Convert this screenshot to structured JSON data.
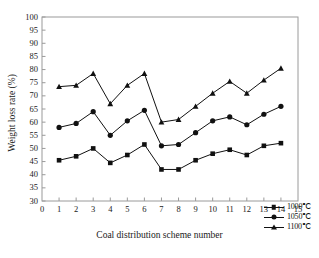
{
  "chart_data": {
    "type": "line",
    "title": "",
    "xlabel": "Coal distribution scheme number",
    "ylabel": "Weight loss rate (%)",
    "xlim": [
      0,
      15
    ],
    "ylim": [
      30,
      100
    ],
    "xticks": [
      0,
      1,
      2,
      3,
      4,
      5,
      6,
      7,
      8,
      9,
      10,
      11,
      12,
      13,
      14,
      15
    ],
    "yticks": [
      30,
      35,
      40,
      45,
      50,
      55,
      60,
      65,
      70,
      75,
      80,
      85,
      90,
      95,
      100
    ],
    "grid": false,
    "legend_position": "lower-right",
    "x": [
      1,
      2,
      3,
      4,
      5,
      6,
      7,
      8,
      9,
      10,
      11,
      12,
      13,
      14
    ],
    "series": [
      {
        "name": "1000℃",
        "marker": "square",
        "color": "#111111",
        "values": [
          45.5,
          47.0,
          50.0,
          44.5,
          47.5,
          51.5,
          42.0,
          42.0,
          45.5,
          48.0,
          49.5,
          47.5,
          51.0,
          52.0
        ]
      },
      {
        "name": "1050℃",
        "marker": "circle",
        "color": "#111111",
        "values": [
          58.0,
          59.5,
          64.0,
          55.0,
          60.5,
          64.5,
          51.0,
          51.5,
          56.0,
          60.5,
          62.0,
          59.0,
          63.0,
          66.0
        ]
      },
      {
        "name": "1100℃",
        "marker": "triangle",
        "color": "#111111",
        "values": [
          73.5,
          74.0,
          78.5,
          67.0,
          74.0,
          78.5,
          60.0,
          61.0,
          66.0,
          71.0,
          75.5,
          71.0,
          76.0,
          80.5
        ]
      }
    ]
  },
  "axes": {
    "frame_color": "#9a9a9a",
    "text_color": "#1a1a1a"
  },
  "legend": {
    "entries": [
      {
        "label": "1000℃",
        "marker": "square"
      },
      {
        "label": "1050℃",
        "marker": "circle"
      },
      {
        "label": "1100℃",
        "marker": "triangle"
      }
    ]
  },
  "background_text": [
    {
      "text": "—"
    }
  ]
}
